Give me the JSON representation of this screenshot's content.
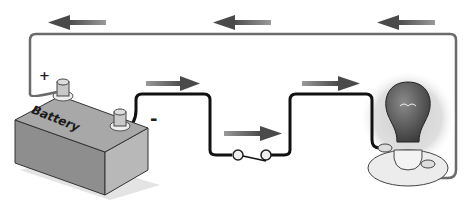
{
  "diagram": {
    "type": "simple-electric-circuit",
    "components": {
      "battery": {
        "label": "Battery",
        "positive_terminal": "+",
        "negative_terminal": "-"
      },
      "switch": {
        "state": "open"
      },
      "bulb": {
        "state": "lit"
      }
    },
    "current_flow": {
      "top_wire_arrows": [
        "left",
        "left",
        "left"
      ],
      "bottom_wire_arrows": [
        "right",
        "right",
        "right"
      ]
    },
    "colors": {
      "wire_top": "#666666",
      "wire_bottom": "#111111",
      "arrow": "#5a5a5a",
      "glow": "#d9d9d9"
    }
  }
}
